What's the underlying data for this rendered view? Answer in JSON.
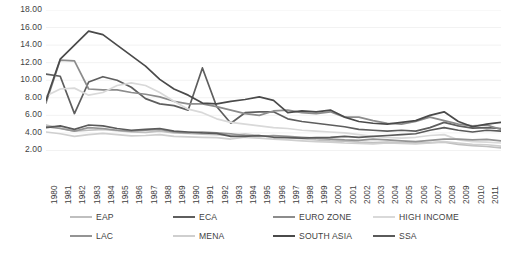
{
  "chart_data": {
    "type": "line",
    "title": "",
    "xlabel": "",
    "ylabel": "",
    "ylim": [
      0.0,
      18.0
    ],
    "ytick_labels": [
      "18.00",
      "16.00",
      "14.00",
      "12.00",
      "10.00",
      "8.00",
      "6.00",
      "4.00",
      "2.00"
    ],
    "ytick_values": [
      18.0,
      16.0,
      14.0,
      12.0,
      10.0,
      8.0,
      6.0,
      4.0,
      2.0
    ],
    "grid": true,
    "grid_axis": "y",
    "legend_position": "bottom",
    "x": [
      1980,
      1981,
      1982,
      1983,
      1984,
      1985,
      1986,
      1987,
      1988,
      1989,
      1990,
      1991,
      1992,
      1993,
      1994,
      1995,
      1996,
      1997,
      1998,
      1999,
      2000,
      2001,
      2002,
      2003,
      2004,
      2005,
      2006,
      2007,
      2008,
      2009,
      2010,
      2011,
      2012
    ],
    "series": [
      {
        "name": "EAP",
        "color": "#bfbfbf",
        "values": [
          4.9,
          4.55,
          4.2,
          4.3,
          4.4,
          4.25,
          4.1,
          4.05,
          4.2,
          4.0,
          3.95,
          3.85,
          3.8,
          3.75,
          3.85,
          3.7,
          3.6,
          3.5,
          3.35,
          3.2,
          3.1,
          3.05,
          2.95,
          2.9,
          2.95,
          2.9,
          2.85,
          2.9,
          2.95,
          2.7,
          2.55,
          2.45,
          2.3
        ]
      },
      {
        "name": "ECA",
        "color": "#5e5e5e",
        "values": [
          10.7,
          10.45,
          6.2,
          9.8,
          10.4,
          10.0,
          9.2,
          7.9,
          7.3,
          7.1,
          6.6,
          11.4,
          7.0,
          5.1,
          6.3,
          6.4,
          6.4,
          5.6,
          5.3,
          5.1,
          4.9,
          4.7,
          4.4,
          4.3,
          4.2,
          4.3,
          4.2,
          4.6,
          5.2,
          4.8,
          4.55,
          4.6,
          4.5
        ]
      },
      {
        "name": "EURO ZONE",
        "color": "#8c8c8c",
        "values": [
          7.4,
          12.3,
          12.2,
          9.0,
          8.9,
          8.9,
          8.6,
          8.4,
          8.1,
          7.6,
          7.3,
          7.3,
          7.0,
          6.6,
          6.2,
          6.0,
          6.5,
          6.6,
          6.3,
          6.2,
          6.4,
          5.8,
          5.8,
          5.4,
          5.1,
          5.0,
          5.3,
          5.8,
          5.4,
          5.0,
          4.8,
          4.9,
          4.4
        ]
      },
      {
        "name": "HIGH INCOME",
        "color": "#d9d9d9",
        "values": [
          8.2,
          9.0,
          9.1,
          8.3,
          8.6,
          9.4,
          9.7,
          9.4,
          8.6,
          7.6,
          6.7,
          6.3,
          5.6,
          5.2,
          5.0,
          4.8,
          4.6,
          4.5,
          4.3,
          4.2,
          4.1,
          4.0,
          3.8,
          3.6,
          3.5,
          3.4,
          3.5,
          3.7,
          3.8,
          3.2,
          3.0,
          2.95,
          2.85
        ]
      },
      {
        "name": "LAC",
        "color": "#949494",
        "values": [
          4.7,
          4.5,
          4.2,
          4.6,
          4.5,
          4.3,
          4.2,
          4.3,
          4.4,
          4.1,
          4.0,
          4.1,
          4.0,
          3.9,
          3.7,
          3.6,
          3.7,
          3.6,
          3.5,
          3.4,
          3.3,
          3.2,
          3.15,
          3.3,
          3.2,
          3.1,
          3.0,
          3.15,
          3.3,
          3.3,
          3.2,
          3.25,
          3.1
        ]
      },
      {
        "name": "MENA",
        "color": "#cfcfcf",
        "values": [
          4.1,
          3.9,
          3.6,
          3.8,
          3.95,
          3.8,
          3.65,
          3.7,
          3.8,
          3.6,
          3.55,
          3.5,
          3.45,
          3.3,
          3.5,
          3.4,
          3.3,
          3.2,
          3.1,
          3.0,
          2.95,
          2.85,
          2.8,
          2.75,
          2.85,
          2.8,
          2.75,
          2.85,
          3.0,
          2.85,
          2.7,
          2.65,
          2.5
        ]
      },
      {
        "name": "SOUTH ASIA",
        "color": "#4a4a4a",
        "values": [
          7.7,
          12.4,
          14.0,
          15.6,
          15.2,
          14.0,
          12.8,
          11.6,
          10.1,
          9.0,
          8.3,
          7.4,
          7.3,
          7.6,
          7.8,
          8.1,
          7.7,
          6.3,
          6.5,
          6.4,
          6.6,
          5.8,
          5.3,
          5.1,
          5.0,
          5.2,
          5.4,
          6.0,
          6.4,
          5.3,
          4.7,
          5.0,
          5.2
        ]
      },
      {
        "name": "SSA",
        "color": "#5a5a5a",
        "values": [
          4.6,
          4.8,
          4.4,
          4.9,
          4.8,
          4.5,
          4.3,
          4.4,
          4.5,
          4.2,
          4.1,
          4.0,
          3.95,
          3.6,
          3.6,
          3.7,
          3.5,
          3.45,
          3.4,
          3.45,
          3.5,
          3.6,
          3.5,
          3.6,
          3.7,
          3.8,
          3.9,
          4.3,
          4.6,
          4.3,
          4.1,
          4.3,
          4.2
        ]
      }
    ]
  },
  "legend": {
    "rows": [
      [
        "EAP",
        "ECA",
        "EURO ZONE",
        "HIGH INCOME"
      ],
      [
        "LAC",
        "MENA",
        "SOUTH ASIA",
        "SSA"
      ]
    ]
  }
}
